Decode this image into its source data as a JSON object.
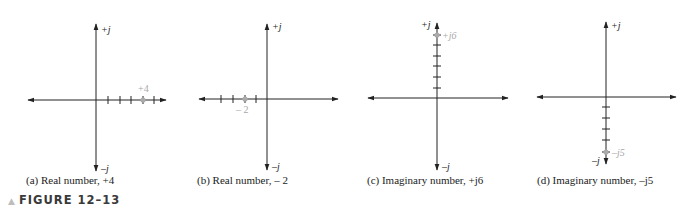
{
  "figure": {
    "label": "FIGURE 12–13",
    "marker_color": "#b0b0b0",
    "axis_color": "#222222",
    "point_color": "#aaaaaa"
  },
  "panels": [
    {
      "id": "a",
      "caption": "(a) Real number, +4",
      "axis_pos_label": "+j",
      "axis_neg_label": "–j",
      "point_label": "+4",
      "point": {
        "real": 4,
        "imag": 0
      }
    },
    {
      "id": "b",
      "caption": "(b) Real number, – 2",
      "axis_pos_label": "+j",
      "axis_neg_label": "–j",
      "point_label": "– 2",
      "point": {
        "real": -2,
        "imag": 0
      }
    },
    {
      "id": "c",
      "caption": "(c) Imaginary number, +j6",
      "axis_pos_label": "+j",
      "axis_neg_label": "–j",
      "point_label": "+j6",
      "point": {
        "real": 0,
        "imag": 6
      }
    },
    {
      "id": "d",
      "caption": "(d) Imaginary number, –j5",
      "axis_pos_label": "+j",
      "axis_neg_label": "–j",
      "point_label": "–j5",
      "point": {
        "real": 0,
        "imag": -5
      }
    }
  ]
}
